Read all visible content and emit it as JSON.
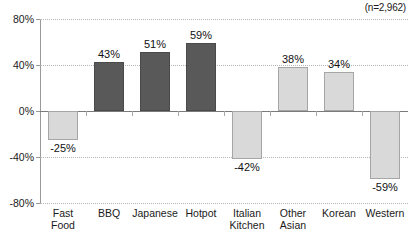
{
  "annotation": {
    "sample_size": "(n=2,962)"
  },
  "chart_data": {
    "type": "bar",
    "title": "",
    "subtitle": "",
    "xlabel": "",
    "ylabel": "",
    "ylim": [
      -80,
      80
    ],
    "grid": true,
    "legend_position": "none",
    "annotations": [
      "(n=2,962)"
    ],
    "ytick_labels": [
      "80%",
      "40%",
      "0%",
      "-40%",
      "-80%"
    ],
    "ytick_values": [
      80,
      40,
      0,
      -40,
      -80
    ],
    "categories": [
      "Fast\nFood",
      "BBQ",
      "Japanese",
      "Hotpot",
      "Italian\nKitchen",
      "Other\nAsian",
      "Korean",
      "Western"
    ],
    "values": [
      -25,
      43,
      51,
      59,
      -42,
      38,
      34,
      -59
    ],
    "value_labels": [
      "-25%",
      "43%",
      "51%",
      "59%",
      "-42%",
      "38%",
      "34%",
      "-59%"
    ],
    "bar_colors": [
      "#d9d9d9",
      "#595959",
      "#595959",
      "#595959",
      "#d9d9d9",
      "#d9d9d9",
      "#d9d9d9",
      "#d9d9d9"
    ],
    "bar_styles": [
      "light",
      "dark",
      "dark",
      "dark",
      "light",
      "light",
      "light",
      "light"
    ]
  },
  "colors": {
    "dark_bar": "#595959",
    "light_bar": "#d9d9d9",
    "gridline": "#b5b5b5",
    "axis": "#9a9a9a",
    "text": "#1a1a1a"
  }
}
